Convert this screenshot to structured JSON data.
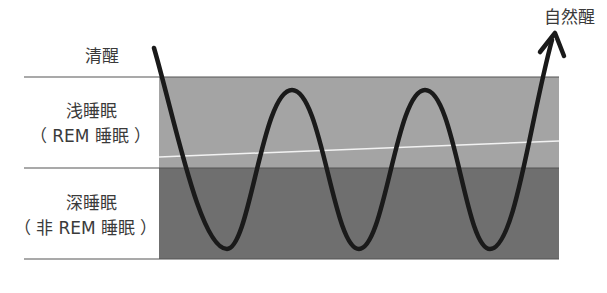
{
  "diagram": {
    "labels": {
      "awake": "清醒",
      "light_sleep": "浅睡眠",
      "light_sleep_sub": "（ REM 睡眠 ）",
      "deep_sleep": "深睡眠",
      "deep_sleep_sub": "（ 非 REM 睡眠 ）",
      "natural_wake": "自然醒"
    },
    "colors": {
      "light_band": "#a4a4a4",
      "deep_band": "#6f6f6f",
      "curve": "#1a1a1a",
      "divider": "#555555",
      "threshold_line": "#f2f2f2"
    },
    "caption": ""
  }
}
